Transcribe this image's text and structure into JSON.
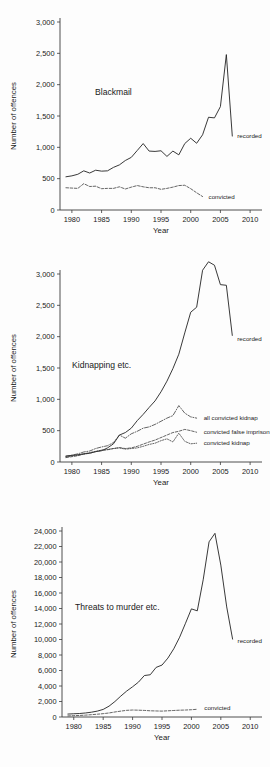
{
  "figure": {
    "axis_title_y": "Number of offences",
    "axis_title_x": "Year",
    "label_recorded": "recorded",
    "label_convicted": "convicted"
  },
  "chart_data": [
    {
      "type": "line",
      "title": "Blackmail",
      "xlabel": "Year",
      "ylabel": "Number of offences",
      "xlim": [
        1978,
        2012
      ],
      "ylim": [
        0,
        3000
      ],
      "grid": false,
      "xticks": [
        1980,
        1985,
        1990,
        1995,
        2000,
        2005,
        2010
      ],
      "xtick_labels": [
        "1980",
        "1985",
        "1990",
        "1995",
        "2000",
        "2005",
        "2010"
      ],
      "yticks": [
        0,
        500,
        1000,
        1500,
        2000,
        2500,
        3000
      ],
      "ytick_labels": [
        "0",
        "500",
        "1,000",
        "1,500",
        "2,000",
        "2,500",
        "3,000"
      ],
      "legend_position": "inline-right",
      "x": [
        1979,
        1980,
        1981,
        1982,
        1983,
        1984,
        1985,
        1986,
        1987,
        1988,
        1989,
        1990,
        1991,
        1992,
        1993,
        1994,
        1995,
        1996,
        1997,
        1998,
        1999,
        2000,
        2001,
        2002,
        2003,
        2004,
        2005,
        2006,
        2007
      ],
      "series": [
        {
          "name": "recorded",
          "style": "solid",
          "label": "recorded",
          "values": [
            530,
            545,
            570,
            625,
            590,
            635,
            620,
            625,
            680,
            720,
            790,
            840,
            950,
            1060,
            940,
            935,
            945,
            855,
            940,
            880,
            1060,
            1145,
            1065,
            1200,
            1480,
            1470,
            1650,
            2480,
            1180
          ]
        },
        {
          "name": "convicted",
          "style": "dashed",
          "label": "convicted",
          "values": [
            355,
            350,
            345,
            420,
            375,
            380,
            340,
            345,
            345,
            370,
            335,
            365,
            390,
            370,
            355,
            355,
            330,
            345,
            365,
            390,
            395,
            340,
            275,
            215,
            null,
            null,
            null,
            null,
            null
          ]
        }
      ]
    },
    {
      "type": "line",
      "title": "Kidnapping etc.",
      "xlabel": "Year",
      "ylabel": "Number of offences",
      "xlim": [
        1978,
        2012
      ],
      "ylim": [
        0,
        3000
      ],
      "grid": false,
      "xticks": [
        1980,
        1985,
        1990,
        1995,
        2000,
        2005,
        2010
      ],
      "xtick_labels": [
        "1980",
        "1985",
        "1990",
        "1995",
        "2000",
        "2005",
        "2010"
      ],
      "yticks": [
        0,
        500,
        1000,
        1500,
        2000,
        2500,
        3000
      ],
      "ytick_labels": [
        "0",
        "500",
        "1,000",
        "1,500",
        "2,000",
        "2,500",
        "3,000"
      ],
      "legend_position": "inline-right",
      "x": [
        1979,
        1980,
        1981,
        1982,
        1983,
        1984,
        1985,
        1986,
        1987,
        1988,
        1989,
        1990,
        1991,
        1992,
        1993,
        1994,
        1995,
        1996,
        1997,
        1998,
        1999,
        2000,
        2001,
        2002,
        2003,
        2004,
        2005,
        2006,
        2007
      ],
      "series": [
        {
          "name": "recorded",
          "style": "solid",
          "label": "recorded",
          "values": [
            95,
            105,
            115,
            130,
            140,
            165,
            180,
            225,
            290,
            430,
            470,
            540,
            660,
            760,
            870,
            975,
            1120,
            1290,
            1490,
            1720,
            2060,
            2390,
            2470,
            3060,
            3195,
            3140,
            2830,
            2820,
            2020
          ]
        },
        {
          "name": "all convicted kidnap",
          "style": "dashdot",
          "label": "all convicted kidnap",
          "values": [
            90,
            110,
            130,
            160,
            175,
            215,
            240,
            260,
            310,
            430,
            380,
            450,
            490,
            540,
            560,
            600,
            650,
            700,
            740,
            900,
            780,
            720,
            700,
            null,
            null,
            null,
            null,
            null,
            null
          ]
        },
        {
          "name": "convicted false imprison",
          "style": "dashed",
          "label": "convicted false imprison",
          "values": [
            70,
            85,
            100,
            125,
            140,
            165,
            185,
            195,
            215,
            230,
            215,
            225,
            250,
            285,
            320,
            350,
            390,
            430,
            470,
            490,
            520,
            500,
            475,
            null,
            null,
            null,
            null,
            null,
            null
          ]
        },
        {
          "name": "convicted kidnap",
          "style": "dotted",
          "label": "convicted kidnap",
          "values": [
            80,
            95,
            110,
            130,
            150,
            170,
            190,
            200,
            215,
            225,
            205,
            215,
            225,
            250,
            280,
            300,
            340,
            370,
            320,
            460,
            330,
            290,
            300,
            null,
            null,
            null,
            null,
            null,
            null
          ]
        }
      ]
    },
    {
      "type": "line",
      "title": "Threats to murder etc.",
      "xlabel": "Year",
      "ylabel": "Number of offences",
      "xlim": [
        1978,
        2012
      ],
      "ylim": [
        0,
        24000
      ],
      "grid": false,
      "xticks": [
        1980,
        1985,
        1990,
        1995,
        2000,
        2005,
        2010
      ],
      "xtick_labels": [
        "1980",
        "1985",
        "1990",
        "1995",
        "2000",
        "2005",
        "2010"
      ],
      "yticks": [
        0,
        2000,
        4000,
        6000,
        8000,
        10000,
        12000,
        14000,
        16000,
        18000,
        20000,
        22000,
        24000
      ],
      "ytick_labels": [
        "0",
        "2,000",
        "4,000",
        "6,000",
        "8,000",
        "10,000",
        "12,000",
        "14,000",
        "16,000",
        "18,000",
        "20,000",
        "22,000",
        "24,000"
      ],
      "legend_position": "inline-right",
      "x": [
        1979,
        1980,
        1981,
        1982,
        1983,
        1984,
        1985,
        1986,
        1987,
        1988,
        1989,
        1990,
        1991,
        1992,
        1993,
        1994,
        1995,
        1996,
        1997,
        1998,
        1999,
        2000,
        2001,
        2002,
        2003,
        2004,
        2005,
        2006,
        2007
      ],
      "series": [
        {
          "name": "recorded",
          "style": "solid",
          "label": "recorded",
          "values": [
            380,
            420,
            450,
            520,
            620,
            760,
            980,
            1400,
            2000,
            2700,
            3350,
            3900,
            4500,
            5350,
            5450,
            6400,
            6700,
            7600,
            8800,
            10300,
            12100,
            13950,
            13700,
            17700,
            22600,
            23700,
            19600,
            14200,
            10050
          ]
        },
        {
          "name": "convicted",
          "style": "dashed",
          "label": "convicted",
          "values": [
            140,
            170,
            200,
            240,
            300,
            360,
            430,
            520,
            650,
            760,
            860,
            900,
            880,
            850,
            800,
            780,
            760,
            800,
            840,
            880,
            900,
            940,
            1000,
            null,
            null,
            null,
            null,
            null,
            null
          ]
        }
      ]
    }
  ]
}
